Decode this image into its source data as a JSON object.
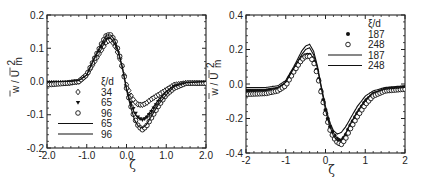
{
  "chart_data": [
    {
      "type": "line",
      "panel": "left",
      "title": "",
      "xlabel": "ζ",
      "ylabel": "w / U_m^2 (overlined)",
      "xlim": [
        -2.0,
        2.0
      ],
      "ylim": [
        -0.2,
        0.2
      ],
      "xticks": [
        "-2.0",
        "-1.0",
        "0.0",
        "1.0",
        "2.0"
      ],
      "yticks": [
        "0.2",
        "0.1",
        "0.0",
        "-0.1",
        "-0.2"
      ],
      "grid": false,
      "legend_title": "ξ/d",
      "legend_position": "center-left, inside",
      "legend": [
        {
          "marker": "diamond-open",
          "label": "34"
        },
        {
          "marker": "triangle-filled",
          "label": "65"
        },
        {
          "marker": "circle-open",
          "label": "96"
        },
        {
          "marker": "line",
          "label": "65"
        },
        {
          "marker": "line",
          "label": "96"
        }
      ],
      "x": [
        -2.0,
        -1.5,
        -1.2,
        -1.0,
        -0.8,
        -0.6,
        -0.5,
        -0.4,
        -0.3,
        -0.2,
        -0.1,
        0.0,
        0.1,
        0.2,
        0.3,
        0.4,
        0.5,
        0.6,
        0.8,
        1.0,
        1.2,
        1.5,
        2.0
      ],
      "series": [
        {
          "name": "34 (symbols)",
          "values": [
            -0.005,
            -0.005,
            0.0,
            0.02,
            0.06,
            0.1,
            0.12,
            0.125,
            0.11,
            0.08,
            0.04,
            -0.01,
            -0.04,
            -0.06,
            -0.07,
            -0.07,
            -0.065,
            -0.055,
            -0.04,
            -0.025,
            -0.01,
            -0.005,
            -0.005
          ]
        },
        {
          "name": "65 (symbols)",
          "values": [
            -0.005,
            -0.005,
            0.0,
            0.02,
            0.07,
            0.11,
            0.13,
            0.135,
            0.12,
            0.09,
            0.04,
            -0.02,
            -0.06,
            -0.09,
            -0.11,
            -0.115,
            -0.11,
            -0.095,
            -0.06,
            -0.035,
            -0.015,
            -0.005,
            -0.005
          ]
        },
        {
          "name": "96 (symbols)",
          "values": [
            -0.01,
            -0.005,
            0.0,
            0.02,
            0.07,
            0.12,
            0.14,
            0.14,
            0.125,
            0.09,
            0.04,
            -0.02,
            -0.07,
            -0.11,
            -0.135,
            -0.145,
            -0.135,
            -0.115,
            -0.075,
            -0.04,
            -0.02,
            -0.005,
            -0.005
          ]
        },
        {
          "name": "65 (line)",
          "values": [
            0.0,
            0.0,
            0.003,
            0.02,
            0.07,
            0.115,
            0.13,
            0.13,
            0.115,
            0.085,
            0.04,
            -0.02,
            -0.065,
            -0.095,
            -0.11,
            -0.115,
            -0.105,
            -0.09,
            -0.055,
            -0.03,
            -0.012,
            -0.003,
            0.0
          ]
        },
        {
          "name": "96 (line)",
          "values": [
            0.0,
            0.0,
            0.003,
            0.02,
            0.075,
            0.12,
            0.14,
            0.14,
            0.125,
            0.09,
            0.04,
            -0.025,
            -0.075,
            -0.115,
            -0.135,
            -0.14,
            -0.13,
            -0.11,
            -0.07,
            -0.04,
            -0.015,
            -0.004,
            0.0
          ]
        }
      ]
    },
    {
      "type": "line",
      "panel": "right",
      "title": "",
      "xlabel": "ζ",
      "ylabel": "w / U_m^2 (overlined)",
      "xlim": [
        -2,
        2
      ],
      "ylim": [
        -0.4,
        0.4
      ],
      "xticks": [
        "-2",
        "-1",
        "0",
        "1",
        "2"
      ],
      "yticks": [
        "0.4",
        "0.2",
        "0.0",
        "-0.2",
        "-0.4"
      ],
      "grid": false,
      "legend_title": "ξ/d",
      "legend_position": "upper-right, inside",
      "legend": [
        {
          "marker": "circle-filled",
          "label": "187"
        },
        {
          "marker": "circle-open",
          "label": "248"
        },
        {
          "marker": "line",
          "label": "187"
        },
        {
          "marker": "line",
          "label": "248"
        }
      ],
      "x": [
        -2.0,
        -1.5,
        -1.2,
        -1.0,
        -0.8,
        -0.6,
        -0.5,
        -0.4,
        -0.3,
        -0.2,
        -0.1,
        0.0,
        0.1,
        0.2,
        0.3,
        0.4,
        0.5,
        0.6,
        0.8,
        1.0,
        1.2,
        1.5,
        2.0
      ],
      "series": [
        {
          "name": "187 (symbols)",
          "values": [
            -0.04,
            -0.04,
            -0.03,
            0.0,
            0.08,
            0.15,
            0.17,
            0.17,
            0.14,
            0.06,
            -0.05,
            -0.15,
            -0.24,
            -0.29,
            -0.32,
            -0.33,
            -0.3,
            -0.25,
            -0.17,
            -0.1,
            -0.06,
            -0.03,
            -0.02
          ]
        },
        {
          "name": "248 (symbols)",
          "values": [
            -0.06,
            -0.055,
            -0.04,
            -0.01,
            0.07,
            0.14,
            0.16,
            0.16,
            0.13,
            0.05,
            -0.06,
            -0.17,
            -0.26,
            -0.31,
            -0.34,
            -0.35,
            -0.32,
            -0.27,
            -0.19,
            -0.12,
            -0.07,
            -0.04,
            -0.03
          ]
        },
        {
          "name": "187 (line)",
          "values": [
            -0.02,
            -0.02,
            -0.01,
            0.02,
            0.1,
            0.19,
            0.22,
            0.23,
            0.19,
            0.1,
            -0.02,
            -0.13,
            -0.22,
            -0.27,
            -0.29,
            -0.28,
            -0.25,
            -0.21,
            -0.13,
            -0.07,
            -0.04,
            -0.02,
            -0.01
          ]
        },
        {
          "name": "248 (line)",
          "values": [
            -0.03,
            -0.03,
            -0.02,
            0.01,
            0.09,
            0.17,
            0.2,
            0.21,
            0.17,
            0.09,
            -0.03,
            -0.15,
            -0.24,
            -0.3,
            -0.33,
            -0.32,
            -0.29,
            -0.24,
            -0.16,
            -0.09,
            -0.05,
            -0.03,
            -0.02
          ]
        }
      ]
    }
  ],
  "panels": {
    "left": {
      "ylabel_main": "w / U",
      "ylabel_sub": "m",
      "ylabel_sup": "2",
      "xlabel": "ζ",
      "legend_title": "ξ/d"
    },
    "right": {
      "ylabel_main": "w / U",
      "ylabel_sub": "m",
      "ylabel_sup": "2",
      "xlabel": "ζ",
      "legend_title": "ξ/d"
    }
  }
}
